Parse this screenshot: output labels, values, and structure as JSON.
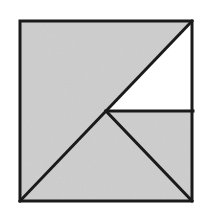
{
  "figure": {
    "description": "A square outlined in black, filled light gray, divided by line segments into four triangular regions, one of which is left white.",
    "canvas": {
      "width": 209,
      "height": 217,
      "background_color": "#ffffff"
    },
    "colors": {
      "background": "#ffffff",
      "shaded_fill": "#cdcdcd",
      "unshaded_fill": "#ffffff",
      "stroke": "#1a1a1a"
    },
    "stroke_width": 3,
    "square": {
      "label": "outer-square",
      "top_left": [
        20,
        21
      ],
      "top_right": [
        192,
        21
      ],
      "bottom_right": [
        192,
        201
      ],
      "bottom_left": [
        20,
        201
      ],
      "width": 172,
      "height": 180
    },
    "points": {
      "top_left": [
        20,
        21
      ],
      "top_right": [
        192,
        21
      ],
      "bottom_right": [
        192,
        201
      ],
      "bottom_left": [
        20,
        201
      ],
      "center": [
        106,
        111
      ],
      "right_mid": [
        192,
        111
      ]
    },
    "segments": [
      {
        "name": "main-diagonal",
        "from": "bottom_left",
        "to": "top_right",
        "from_point": [
          20,
          201
        ],
        "to_point": [
          192,
          21
        ]
      },
      {
        "name": "center-horizontal",
        "from": "center",
        "to": "right_mid",
        "from_point": [
          106,
          111
        ],
        "to_point": [
          192,
          111
        ]
      },
      {
        "name": "center-to-bottom-right-diagonal",
        "from": "center",
        "to": "bottom_right",
        "from_point": [
          106,
          111
        ],
        "to_point": [
          192,
          201
        ]
      }
    ],
    "regions": [
      {
        "name": "upper-left-triangle",
        "fill": "#cdcdcd",
        "shaded": true,
        "vertices": [
          [
            20,
            21
          ],
          [
            192,
            21
          ],
          [
            20,
            201
          ]
        ],
        "polygon": "20,21 192,21 20,201"
      },
      {
        "name": "upper-right-triangle",
        "fill": "#ffffff",
        "shaded": false,
        "vertices": [
          [
            192,
            21
          ],
          [
            192,
            111
          ],
          [
            106,
            111
          ]
        ],
        "polygon": "192,21 192,111 106,111"
      },
      {
        "name": "right-middle-triangle",
        "fill": "#cdcdcd",
        "shaded": true,
        "vertices": [
          [
            106,
            111
          ],
          [
            192,
            111
          ],
          [
            192,
            201
          ]
        ],
        "polygon": "106,111 192,111 192,201"
      },
      {
        "name": "bottom-triangle",
        "fill": "#cdcdcd",
        "shaded": true,
        "vertices": [
          [
            20,
            201
          ],
          [
            106,
            111
          ],
          [
            192,
            201
          ]
        ],
        "polygon": "20,201 106,111 192,201"
      }
    ],
    "region_count": 4,
    "shaded_region_count": 3,
    "unshaded_region_count": 1
  }
}
